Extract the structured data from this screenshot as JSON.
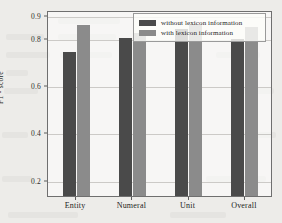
{
  "chart_data": {
    "type": "bar",
    "title": "",
    "subtitle": "",
    "xlabel": "",
    "ylabel": "F1 - score",
    "categories": [
      "Entity",
      "Numeral",
      "Unit",
      "Overall"
    ],
    "series": [
      {
        "name": "without lexicon information",
        "color": "#4a4a4a",
        "values": [
          0.74,
          0.803,
          0.838,
          0.798
        ]
      },
      {
        "name": "with lexicon information",
        "color": "#8b8b8b",
        "values": [
          0.855,
          0.822,
          0.862,
          0.848
        ]
      }
    ],
    "ylim": [
      0.13,
      0.92
    ],
    "yticks": [
      0.2,
      0.4,
      0.6,
      0.8,
      0.9
    ],
    "ytick_labels": [
      "0.2",
      "0.4",
      "0.6",
      "0.8",
      "0.9"
    ],
    "grid": true,
    "grid_axis": "y",
    "legend_position": "top-right",
    "bar_group_gap": 0.45,
    "background_color": "#f2f1ee",
    "axis_color": "#6f6f6f"
  }
}
